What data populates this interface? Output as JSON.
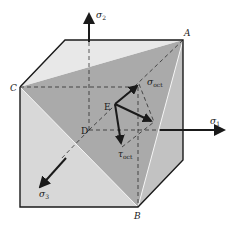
{
  "figure": {
    "colors": {
      "background": "#ffffff",
      "top_face": "#e4e4e4",
      "front_face": "#d6d6d6",
      "side_face": "#bdbdbd",
      "octahedral_plane": "#a9a9a9",
      "edge": "#1a1a1a",
      "highlight_edge": "#f4f4f4"
    },
    "vertices": {
      "A": "A",
      "B": "B",
      "C": "C",
      "D": "D",
      "E": "E"
    },
    "axes": {
      "sigma1": {
        "symbol": "σ",
        "sub": "1"
      },
      "sigma2": {
        "symbol": "σ",
        "sub": "2"
      },
      "sigma3": {
        "symbol": "σ",
        "sub": "3"
      }
    },
    "vectors": {
      "sigma_oct": {
        "symbol": "σ",
        "sub": "oct"
      },
      "tau_oct": {
        "symbol": "τ",
        "sub": "oct"
      }
    }
  }
}
